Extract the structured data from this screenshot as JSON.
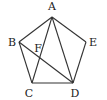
{
  "diagram": {
    "type": "geometry",
    "points": {
      "A": {
        "label": "A",
        "x": 52,
        "y": 17,
        "lx": 52,
        "ly": 10
      },
      "B": {
        "label": "B",
        "x": 19,
        "y": 42,
        "lx": 12,
        "ly": 46
      },
      "C": {
        "label": "C",
        "x": 32,
        "y": 83,
        "lx": 29,
        "ly": 97
      },
      "D": {
        "label": "D",
        "x": 73,
        "y": 83,
        "lx": 75,
        "ly": 97
      },
      "E": {
        "label": "E",
        "x": 86,
        "y": 42,
        "lx": 93,
        "ly": 46
      },
      "F": {
        "label": "F",
        "x": 39,
        "y": 57,
        "lx": 38,
        "ly": 52
      }
    },
    "segments": [
      [
        "A",
        "B"
      ],
      [
        "B",
        "C"
      ],
      [
        "C",
        "D"
      ],
      [
        "D",
        "E"
      ],
      [
        "E",
        "A"
      ],
      [
        "A",
        "C"
      ],
      [
        "A",
        "D"
      ],
      [
        "B",
        "D"
      ]
    ]
  }
}
